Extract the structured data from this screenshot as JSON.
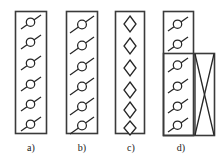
{
  "figure": {
    "title": "",
    "background_color": "#ffffff",
    "stroke_color": "#262626",
    "panel_border_color": "#3a3a3a"
  },
  "panels": [
    {
      "id": "a",
      "caption": "a)",
      "symbol": "circle-with-diagonal-line",
      "symbol_name": "loop-on-diagonal-short",
      "symbol_count": 6,
      "rect": {
        "x": 15,
        "y": 11,
        "width": 32,
        "height": 123
      },
      "caption_pos": {
        "x": 16,
        "y": 142
      },
      "extra_rect": null,
      "has_cross": false
    },
    {
      "id": "b",
      "caption": "b)",
      "symbol": "circle-with-diagonal-line",
      "symbol_name": "loop-on-diagonal-long",
      "symbol_count": 6,
      "rect": {
        "x": 66,
        "y": 11,
        "width": 32,
        "height": 123
      },
      "caption_pos": {
        "x": 67,
        "y": 142
      },
      "extra_rect": null,
      "has_cross": false
    },
    {
      "id": "c",
      "caption": "c)",
      "symbol": "diamond",
      "symbol_name": "diamond-outline",
      "symbol_count": 6,
      "rect": {
        "x": 115,
        "y": 11,
        "width": 30,
        "height": 123
      },
      "caption_pos": {
        "x": 116,
        "y": 142
      },
      "extra_rect": null,
      "has_cross": false
    },
    {
      "id": "d",
      "caption": "d)",
      "symbol": "circle-with-diagonal-line",
      "symbol_name": "loop-on-diagonal-short",
      "symbol_count": 6,
      "rect": {
        "x": 163,
        "y": 11,
        "width": 31,
        "height": 125
      },
      "caption_pos": {
        "x": 166,
        "y": 142
      },
      "extra_rect": {
        "x": 163,
        "y": 53,
        "width": 52,
        "height": 83
      },
      "has_cross": true,
      "cross_region": {
        "x": 194,
        "y": 53,
        "width": 21,
        "height": 83
      }
    }
  ],
  "labels": {
    "a": "a)",
    "b": "b)",
    "c": "c)",
    "d": "d)"
  }
}
